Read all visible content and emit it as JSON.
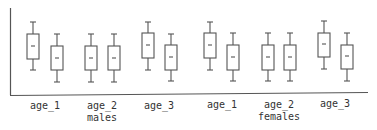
{
  "chart_data": {
    "type": "box",
    "title": "",
    "xlabel": "",
    "ylabel": "",
    "grid": false,
    "groups": [
      "males",
      "females"
    ],
    "categories": [
      "age_1",
      "age_2",
      "age_3",
      "age_1",
      "age_2",
      "age_3"
    ],
    "tick_labels": [
      {
        "label": "age_1",
        "group": ""
      },
      {
        "label": "age_2",
        "group": "males"
      },
      {
        "label": "age_3",
        "group": ""
      },
      {
        "label": "age_1",
        "group": ""
      },
      {
        "label": "age_2",
        "group": "females"
      },
      {
        "label": "age_3",
        "group": ""
      }
    ],
    "boxes": [
      {
        "category": "age_1",
        "group": "males",
        "pair_index": 0,
        "whisker_low": 70,
        "q1": 59,
        "median": 46,
        "q3": 34,
        "whisker_high": 22
      },
      {
        "category": "age_1",
        "group": "males",
        "pair_index": 1,
        "whisker_low": 82,
        "q1": 70,
        "median": 58,
        "q3": 46,
        "whisker_high": 34
      },
      {
        "category": "age_2",
        "group": "males",
        "pair_index": 0,
        "whisker_low": 82,
        "q1": 70,
        "median": 58,
        "q3": 46,
        "whisker_high": 34
      },
      {
        "category": "age_2",
        "group": "males",
        "pair_index": 1,
        "whisker_low": 82,
        "q1": 70,
        "median": 58,
        "q3": 46,
        "whisker_high": 34
      },
      {
        "category": "age_3",
        "group": "males",
        "pair_index": 0,
        "whisker_low": 70,
        "q1": 58,
        "median": 45,
        "q3": 33,
        "whisker_high": 22
      },
      {
        "category": "age_3",
        "group": "males",
        "pair_index": 1,
        "whisker_low": 81,
        "q1": 70,
        "median": 57,
        "q3": 45,
        "whisker_high": 34
      },
      {
        "category": "age_1",
        "group": "females",
        "pair_index": 0,
        "whisker_low": 70,
        "q1": 58,
        "median": 45,
        "q3": 33,
        "whisker_high": 22
      },
      {
        "category": "age_1",
        "group": "females",
        "pair_index": 1,
        "whisker_low": 81,
        "q1": 70,
        "median": 57,
        "q3": 45,
        "whisker_high": 33
      },
      {
        "category": "age_2",
        "group": "females",
        "pair_index": 0,
        "whisker_low": 81,
        "q1": 70,
        "median": 57,
        "q3": 45,
        "whisker_high": 33
      },
      {
        "category": "age_2",
        "group": "females",
        "pair_index": 1,
        "whisker_low": 81,
        "q1": 70,
        "median": 57,
        "q3": 45,
        "whisker_high": 33
      },
      {
        "category": "age_3",
        "group": "females",
        "pair_index": 0,
        "whisker_low": 69,
        "q1": 57,
        "median": 44,
        "q3": 33,
        "whisker_high": 21
      },
      {
        "category": "age_3",
        "group": "females",
        "pair_index": 1,
        "whisker_low": 81,
        "q1": 69,
        "median": 56,
        "q3": 45,
        "whisker_high": 33
      }
    ],
    "value_note": "values are pixel y-positions (no y-axis ticks shown)",
    "colors": {
      "box": "#555555",
      "axis": "#555555",
      "text": "#333333"
    }
  }
}
